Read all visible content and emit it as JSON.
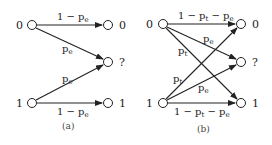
{
  "panels": [
    {
      "caption": "(a)",
      "inputs": [
        "0",
        "1"
      ],
      "outputs": [
        "0",
        "?",
        "1"
      ],
      "edges": [
        {
          "from": "0",
          "to": "0",
          "label": "1 − p",
          "sub": "e"
        },
        {
          "from": "0",
          "to": "?",
          "label": "p",
          "sub": "e"
        },
        {
          "from": "1",
          "to": "?",
          "label": "p",
          "sub": "e"
        },
        {
          "from": "1",
          "to": "1",
          "label": "1 − p",
          "sub": "e"
        }
      ]
    },
    {
      "caption": "(b)",
      "inputs": [
        "0",
        "1"
      ],
      "outputs": [
        "0",
        "?",
        "1"
      ],
      "edges": [
        {
          "from": "0",
          "to": "0",
          "label": "1 − p",
          "sub": "t",
          "label2": " − p",
          "sub2": "e"
        },
        {
          "from": "0",
          "to": "?",
          "label": "p",
          "sub": "e"
        },
        {
          "from": "0",
          "to": "1",
          "label": "p",
          "sub": "t"
        },
        {
          "from": "1",
          "to": "0",
          "label": "p",
          "sub": "t"
        },
        {
          "from": "1",
          "to": "?",
          "label": "p",
          "sub": "e"
        },
        {
          "from": "1",
          "to": "1",
          "label": "1 − p",
          "sub": "t",
          "label2": " − p",
          "sub2": "e"
        }
      ]
    }
  ]
}
